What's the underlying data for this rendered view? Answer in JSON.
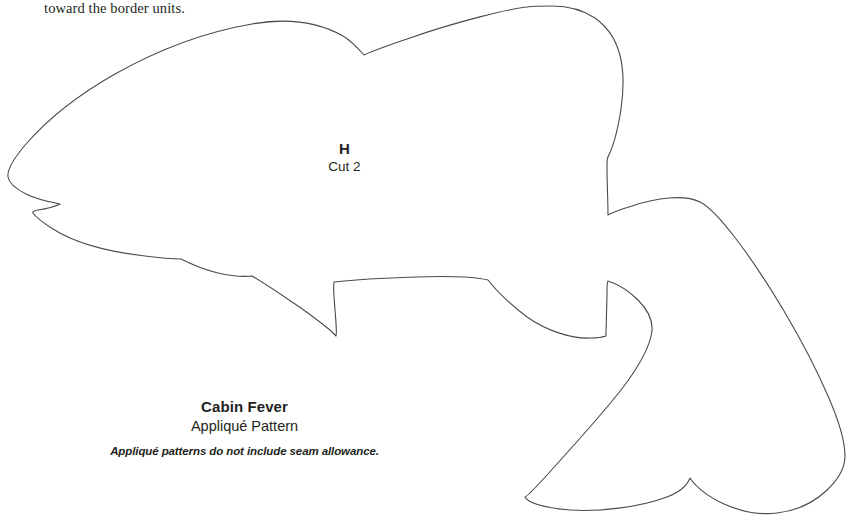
{
  "page": {
    "background_color": "#ffffff",
    "width": 850,
    "height": 520
  },
  "header": {
    "text": "toward the border units."
  },
  "piece_label": {
    "letter": "H",
    "cut_instruction": "Cut 2"
  },
  "caption": {
    "title": "Cabin Fever",
    "subtitle": "Appliqué Pattern",
    "note": "Appliqué patterns do not include seam allowance."
  },
  "pattern": {
    "name": "fish-appliqué-outline",
    "stroke_color": "#4a4a4a",
    "stroke_width": 1.1,
    "fill": "none",
    "path": "M 527 7 L 528 7 C 512 8 455 22 410 38 C 392 44 375 50 364 55 C 356 46 350 40 343 36 C 318 22 286 18 252 24 C 205 32 156 51 115 74 C 78 95 47 120 26 144 C 14 158 7 170 8 177 C 9 183 16 189 26 194 C 36 199 49 202 60 204 C 54 207 45 209 38 210 C 34 211 32 212 33 213 C 35 216 42 222 53 229 C 75 243 110 252 145 256 C 160 258 172 259 181 259 C 193 265 205 270 218 273 C 231 276 243 277 252 276 C 262 282 276 291 292 302 C 306 311 320 322 330 330 C 333 333 335 335 336 336 C 337 332 336 322 335 310 C 334 297 333 287 334 282 C 352 280 385 278 416 277 C 447 276 475 277 488 280 C 495 289 510 304 527 317 C 547 331 572 339 591 338 C 598 338 603 337 606 336 C 606 325 607 305 607 292 C 607 286 607 282 608 281 C 617 284 629 291 638 300 C 648 310 653 321 652 331 C 650 347 638 368 621 390 C 601 415 576 443 556 465 C 540 483 529 495 525 497 C 528 503 545 508 570 510 C 600 512 639 507 664 498 C 679 493 687 486 690 478 C 696 487 709 497 724 504 C 742 512 761 515 777 513 C 795 511 813 503 826 491 C 838 480 845 467 845 456 C 845 443 839 421 828 396 C 816 368 800 338 784 311 C 766 281 748 254 733 235 C 719 217 708 206 700 202 C 692 198 681 197 669 198 C 657 199 644 202 632 206 C 622 209 613 212 608 215 C 608 203 607 181 607 167 C 607 161 607 158 608 157 C 613 147 618 129 621 109 C 624 88 624 68 619 52 C 615 38 606 26 595 18 C 583 10 568 6 552 6 C 543 6 534 6 527 7 Z",
    "sub_paths": [
      {
        "name": "dorsal-notch",
        "description": "V notch at top where dorsal fin meets back"
      },
      {
        "name": "mouth-notch",
        "description": "pointed mouth notch at left snout"
      },
      {
        "name": "pelvic-fin",
        "description": "pointed fin on lower belly"
      },
      {
        "name": "caudal-fork",
        "description": "forked tail with two lobes"
      }
    ]
  }
}
